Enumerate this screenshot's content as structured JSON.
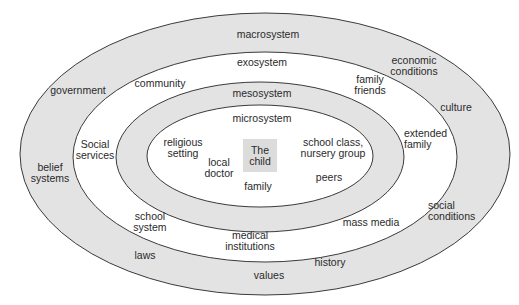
{
  "diagram": {
    "colors": {
      "ring_fill": "#e3e3e3",
      "inner_fill": "#ffffff",
      "stroke": "#3a3a3a",
      "child_box": "#dcdcdc"
    },
    "rings": [
      {
        "name": "macrosystem",
        "cx": 265,
        "cy": 154,
        "rx": 245,
        "ry": 141,
        "fill": "#e3e3e3"
      },
      {
        "name": "exosystem",
        "cx": 265,
        "cy": 157,
        "rx": 192,
        "ry": 105,
        "fill": "#ffffff"
      },
      {
        "name": "mesosystem",
        "cx": 260,
        "cy": 157,
        "rx": 144,
        "ry": 75,
        "fill": "#e3e3e3"
      },
      {
        "name": "microsystem",
        "cx": 260,
        "cy": 156,
        "rx": 113,
        "ry": 51,
        "fill": "#ffffff"
      }
    ],
    "system_labels": {
      "macrosystem": "macrosystem",
      "exosystem": "exosystem",
      "mesosystem": "mesosystem",
      "microsystem": "microsystem"
    },
    "center": "The\nchild",
    "microsystem_items": {
      "religious_setting": "religious\nsetting",
      "local_doctor": "local\ndoctor",
      "family": "family",
      "school_class": "school class,\nnursery group",
      "peers": "peers"
    },
    "exosystem_items": {
      "community": "community",
      "family_friends": "family\nfriends",
      "social_services": "Social\nservices",
      "extended_family": "extended\nfamily",
      "school_system": "school\nsystem",
      "mass_media": "mass media",
      "medical_institutions": "medical\ninstitutions"
    },
    "macrosystem_items": {
      "government": "government",
      "economic_conditions": "economic\nconditions",
      "culture": "culture",
      "belief_systems": "belief\nsystems",
      "social_conditions": "social\nconditions",
      "laws": "laws",
      "history": "history",
      "values": "values"
    }
  }
}
